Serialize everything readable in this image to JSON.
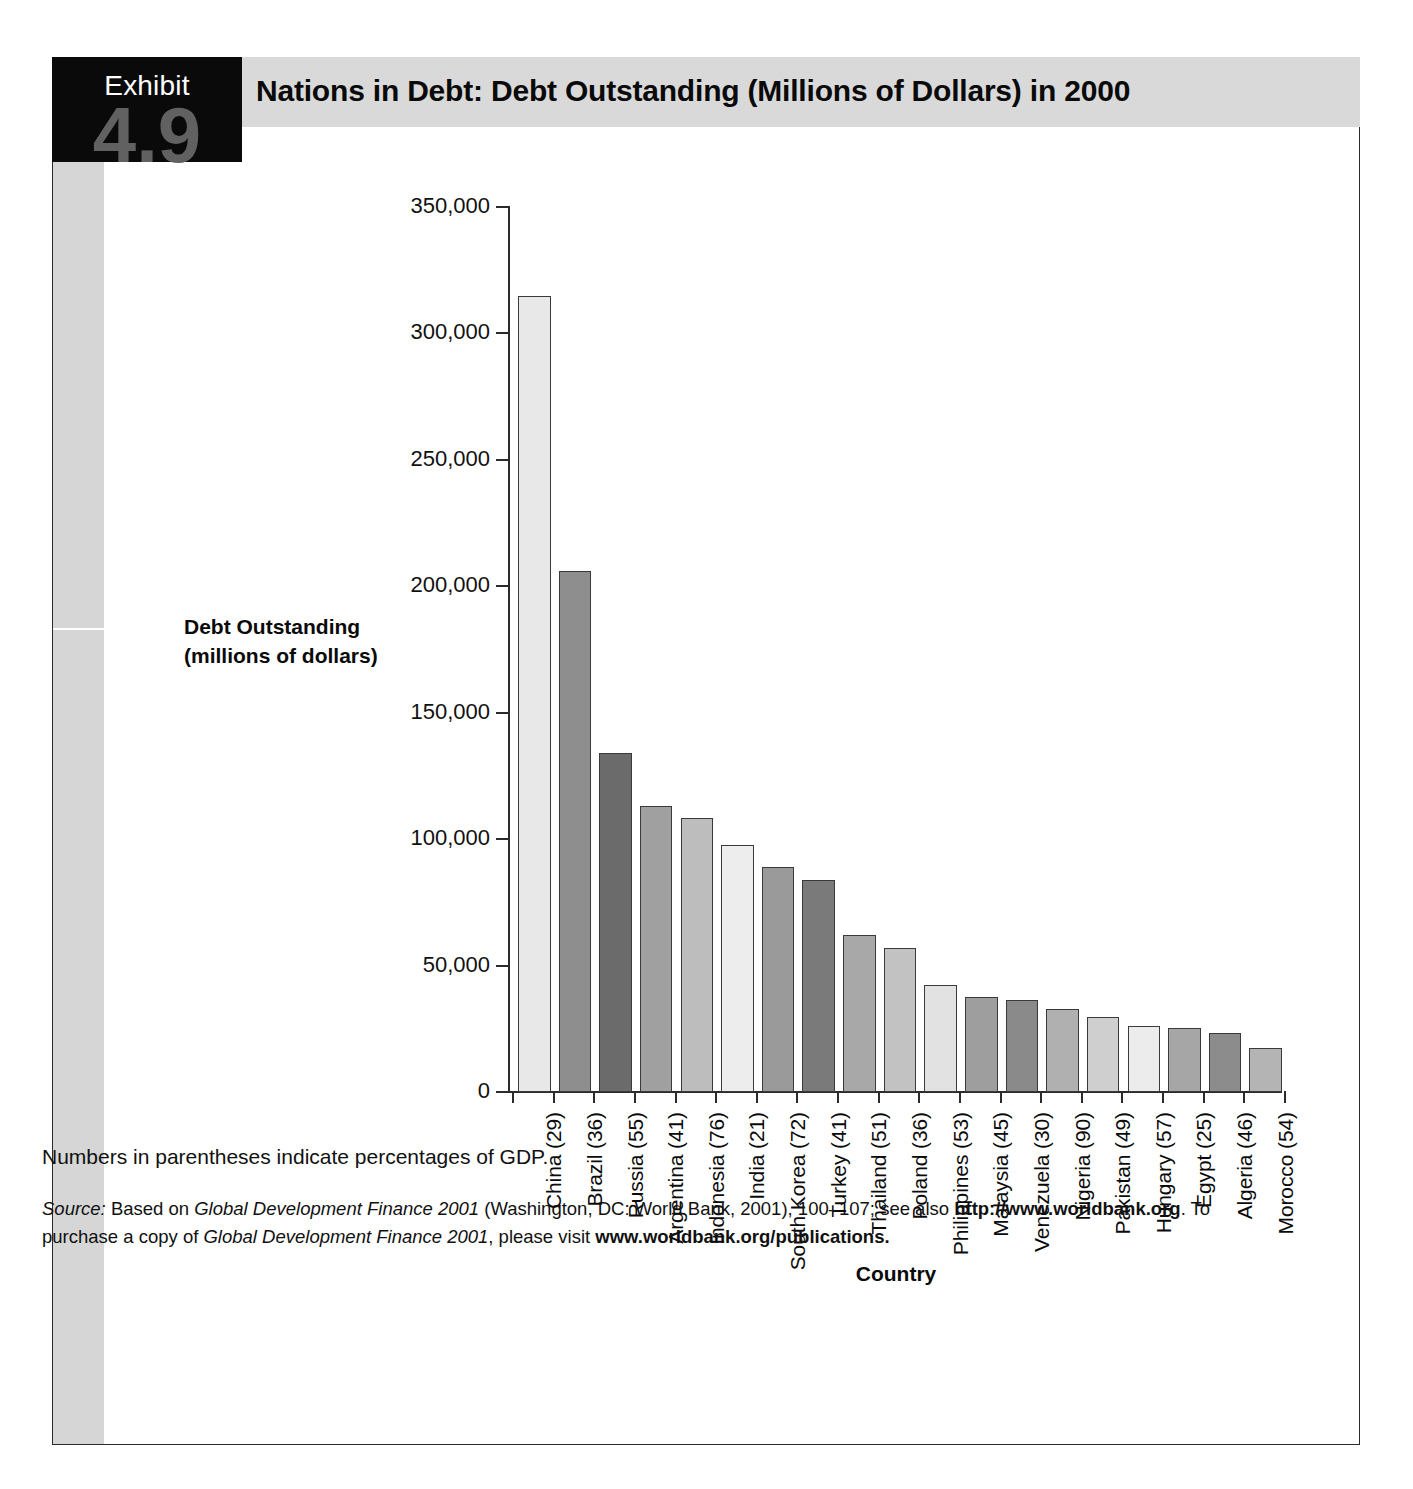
{
  "exhibit": {
    "label": "Exhibit",
    "number": "4.9",
    "title": "Nations in Debt: Debt Outstanding (Millions of Dollars) in 2000"
  },
  "notes": {
    "footnote": "Numbers in parentheses indicate percentages of GDP.",
    "source_prefix": "Source:",
    "source_line1_a": " Based on ",
    "source_italic1": "Global Development Finance 2001",
    "source_line1_b": " (Washington, DC: World Bank, 2001), 100–107; see also ",
    "source_url1": "http://www.worldbank.org",
    "source_line1_c": ". To",
    "source_line2_a": "purchase a copy of ",
    "source_italic2": "Global Development Finance 2001",
    "source_line2_b": ", please visit ",
    "source_url2": "www.worldbank.org/publications."
  },
  "chart_data": {
    "type": "bar",
    "title": "Nations in Debt: Debt Outstanding (Millions of Dollars) in 2000",
    "xlabel": "Country",
    "ylabel": "Debt Outstanding\n(millions of dollars)",
    "ylabel_line1": "Debt Outstanding",
    "ylabel_line2": "(millions of dollars)",
    "ylim": [
      0,
      350000
    ],
    "ytick_labels": [
      "350,000",
      "300,000",
      "250,000",
      "200,000",
      "150,000",
      "100,000",
      "50,000",
      "0"
    ],
    "ytick_values": [
      350000,
      300000,
      250000,
      200000,
      150000,
      100000,
      50000,
      0
    ],
    "grid": false,
    "legend": "none",
    "unit": "millions of dollars",
    "annotation": "Numbers in parentheses indicate percentages of GDP.",
    "categories": [
      "China (29)",
      "Brazil (36)",
      "Russia (55)",
      "Argentina (41)",
      "Indonesia (76)",
      "India (21)",
      "South Korea (72)",
      "Turkey (41)",
      "Thailand (51)",
      "Poland (36)",
      "Philippines (53)",
      "Malaysia (45)",
      "Venezuela (30)",
      "Nigeria (90)",
      "Pakistan (49)",
      "Hungary (57)",
      "Egypt (25)",
      "Algeria (46)",
      "Morocco (54)"
    ],
    "countries": [
      "China",
      "Brazil",
      "Russia",
      "Argentina",
      "Indonesia",
      "India",
      "South Korea",
      "Turkey",
      "Thailand",
      "Poland",
      "Philippines",
      "Malaysia",
      "Venezuela",
      "Nigeria",
      "Pakistan",
      "Hungary",
      "Egypt",
      "Algeria",
      "Morocco"
    ],
    "gdp_percentages": [
      29,
      36,
      55,
      41,
      76,
      21,
      72,
      41,
      51,
      36,
      53,
      45,
      30,
      90,
      49,
      57,
      25,
      46,
      54
    ],
    "values": [
      315000,
      206000,
      134000,
      113000,
      108500,
      97500,
      89000,
      84000,
      62000,
      57000,
      42500,
      37500,
      36500,
      33000,
      29500,
      26000,
      25500,
      23500,
      17500
    ],
    "bar_colors": [
      "#e8e8e8",
      "#8e8e8e",
      "#6b6b6b",
      "#a0a0a0",
      "#bdbdbd",
      "#ededed",
      "#9a9a9a",
      "#7a7a7a",
      "#a8a8a8",
      "#c2c2c2",
      "#e2e2e2",
      "#9e9e9e",
      "#8a8a8a",
      "#b0b0b0",
      "#cfcfcf",
      "#ececec",
      "#a6a6a6",
      "#8c8c8c",
      "#b4b4b4"
    ]
  }
}
